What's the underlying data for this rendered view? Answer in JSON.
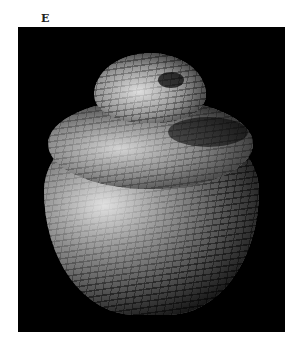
{
  "figure": {
    "panel_label": "E",
    "image": {
      "subject": "coiled woven basket with lid",
      "background_color": "#000000",
      "description": "Black-and-white photograph of a coiled basket with a domed lid, lit from the left"
    }
  }
}
